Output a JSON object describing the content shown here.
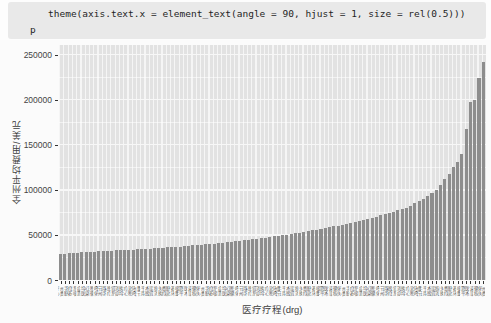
{
  "code_cell": {
    "line1": "theme(axis.text.x = element_text(angle = 90, hjust = 1, size = rel(0.5)))",
    "line2": "p"
  },
  "chart_data": {
    "type": "bar",
    "title": "",
    "xlabel": "医疗疗程(drg)",
    "ylabel": "全州平均费用/美元",
    "y_ticks": [
      0,
      50000,
      100000,
      150000,
      200000,
      250000
    ],
    "y_minor_ticks": [
      25000,
      75000,
      125000,
      175000,
      225000
    ],
    "ylim": [
      0,
      260700
    ],
    "grid": "on",
    "legend": "none",
    "n_bars": 100,
    "values": [
      28800,
      29200,
      29600,
      30000,
      30300,
      30600,
      30900,
      31200,
      31500,
      31800,
      32000,
      32300,
      32500,
      32800,
      33000,
      33300,
      33500,
      33800,
      34000,
      34300,
      34600,
      34900,
      35200,
      35500,
      35800,
      36100,
      36400,
      36800,
      37100,
      37500,
      37900,
      38300,
      38700,
      39100,
      39500,
      40000,
      40400,
      40900,
      41400,
      41900,
      42400,
      42900,
      43500,
      44000,
      44600,
      45200,
      45800,
      46400,
      47000,
      47700,
      48300,
      49000,
      49700,
      50400,
      51100,
      51900,
      52600,
      53400,
      54200,
      55000,
      55900,
      56700,
      57600,
      58500,
      59500,
      60400,
      61400,
      62400,
      63500,
      64500,
      65600,
      66800,
      67900,
      69100,
      70400,
      71600,
      73000,
      74300,
      75700,
      77200,
      78700,
      80300,
      82500,
      85000,
      87500,
      90000,
      93000,
      96000,
      100000,
      105000,
      112000,
      118000,
      125000,
      131000,
      140000,
      168000,
      197000,
      200000,
      224000,
      242000
    ],
    "x_tick_labels_note": "100 Chinese DRG treatment names rotated 90°, illegible at rel(0.5) size",
    "x_tick_glyph_pool": "州平均费用医疗手术心脏感染治疗诊断器官循环系统呼吸消化重症关节置换"
  },
  "colors": {
    "code_bg": "#e9e9e9",
    "panel_bg": "#e2e2e2",
    "bar_fill": "#8d8d8d",
    "grid_major": "#f7f7f7",
    "axis_text": "#444444"
  }
}
